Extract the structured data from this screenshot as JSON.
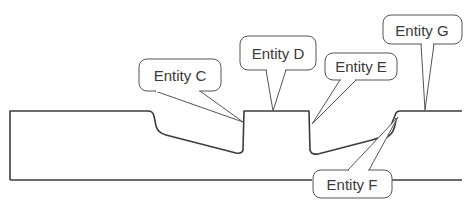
{
  "diagram": {
    "title": "",
    "colors": {
      "stroke": "#3c3c3c",
      "callout_stroke": "#555555",
      "text": "#3a3a3a",
      "background": "#ffffff"
    },
    "callouts": [
      {
        "id": "C",
        "label": "Entity C"
      },
      {
        "id": "D",
        "label": "Entity D"
      },
      {
        "id": "E",
        "label": "Entity E"
      },
      {
        "id": "F",
        "label": "Entity F"
      },
      {
        "id": "G",
        "label": "Entity G"
      }
    ]
  }
}
